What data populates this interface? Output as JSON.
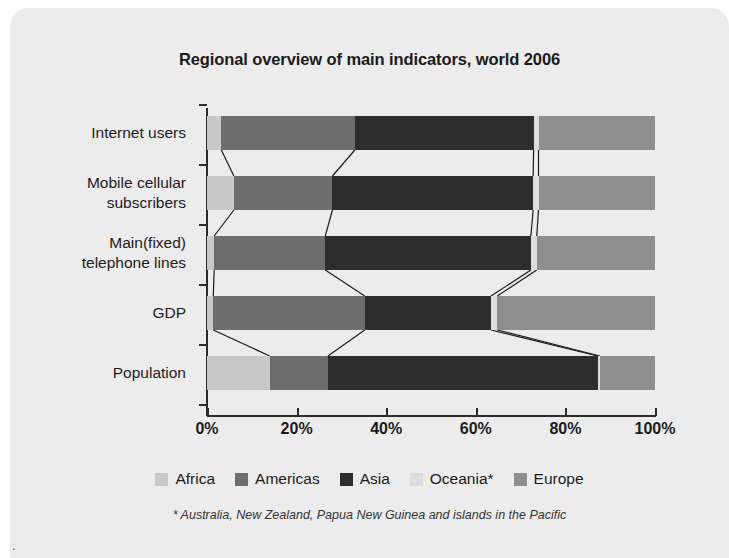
{
  "chart_data": {
    "type": "bar",
    "subtype": "stacked-horizontal-100-percent",
    "title": "Regional overview of main indicators, world 2006",
    "xlabel": "",
    "ylabel": "",
    "xlim": [
      0,
      100
    ],
    "xticks": [
      "0%",
      "20%",
      "40%",
      "60%",
      "80%",
      "100%"
    ],
    "xtick_values": [
      0,
      20,
      40,
      60,
      80,
      100
    ],
    "grid": false,
    "legend_position": "bottom",
    "categories": [
      "Internet users",
      "Mobile cellular subscribers",
      "Main(fixed) telephone lines",
      "GDP",
      "Population"
    ],
    "category_labels_multiline": [
      "Internet users",
      "Mobile cellular\nsubscribers",
      "Main(fixed)\ntelephone lines",
      "GDP",
      "Population"
    ],
    "series": [
      {
        "name": "Africa",
        "color": "#c8c8c8",
        "values": [
          3.2,
          6.0,
          1.6,
          1.4,
          14.0
        ]
      },
      {
        "name": "Americas",
        "color": "#6d6d6d",
        "values": [
          29.8,
          22.0,
          24.8,
          33.8,
          13.0
        ]
      },
      {
        "name": "Asia",
        "color": "#2d2d2d",
        "values": [
          39.9,
          44.8,
          45.9,
          28.2,
          60.2
        ]
      },
      {
        "name": "Oceania*",
        "color": "#dcdcdc",
        "values": [
          1.1,
          1.2,
          1.3,
          1.4,
          0.5
        ]
      },
      {
        "name": "Europe",
        "color": "#8e8e8e",
        "values": [
          26.0,
          26.0,
          26.4,
          35.2,
          12.3
        ]
      }
    ],
    "annotations": {
      "footnote": "* Australia, New Zealand, Papua New Guinea and islands in the Pacific"
    }
  },
  "legend": {
    "items": [
      {
        "label": "Africa",
        "color": "#c8c8c8"
      },
      {
        "label": "Americas",
        "color": "#6d6d6d"
      },
      {
        "label": "Asia",
        "color": "#2d2d2d"
      },
      {
        "label": "Oceania*",
        "color": "#dcdcdc"
      },
      {
        "label": "Europe",
        "color": "#8e8e8e"
      }
    ]
  },
  "footnote": "* Australia, New Zealand, Papua New Guinea and islands in the Pacific",
  "colors": {
    "background": "#ececec",
    "page": "#ffffff",
    "axis": "#2a2a2a",
    "text": "#1b1b1b",
    "connector": "#1b1b1b"
  }
}
